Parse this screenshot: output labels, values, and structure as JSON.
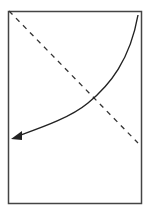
{
  "diagram": {
    "width": 151,
    "height": 212,
    "background": "#ffffff",
    "stroke_color": "#333333",
    "frame": {
      "x": 8.5,
      "y": 11.5,
      "w": 133,
      "h": 192
    },
    "dashed_line": {
      "x1": 9,
      "y1": 11,
      "x2": 138,
      "y2": 143,
      "dash": "5,5"
    },
    "curved_arrow": {
      "path": "M138 15 C 130 60, 110 85, 88 103 C 70 118, 40 128, 18 136",
      "head": "11,139 22,131 22,140"
    }
  }
}
